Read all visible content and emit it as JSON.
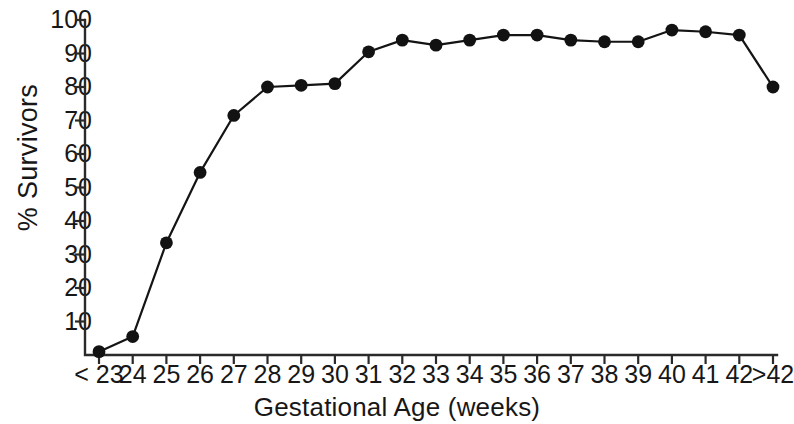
{
  "chart_data": {
    "type": "line",
    "title": "",
    "xlabel": "Gestational Age (weeks)",
    "ylabel": "% Survivors",
    "categories": [
      "< 23",
      "24",
      "25",
      "26",
      "27",
      "28",
      "29",
      "30",
      "31",
      "32",
      "33",
      "34",
      "35",
      "36",
      "37",
      "38",
      "39",
      "40",
      "41",
      "42",
      ">42"
    ],
    "values": [
      1,
      5.5,
      33.5,
      54.5,
      71.5,
      80,
      80.5,
      81,
      90.5,
      94,
      92.5,
      94,
      95.5,
      95.5,
      94,
      93.5,
      93.5,
      97,
      96.5,
      95.5,
      80
    ],
    "ylim": [
      0,
      100
    ],
    "yticks": [
      0,
      10,
      20,
      30,
      40,
      50,
      60,
      70,
      80,
      90,
      100
    ],
    "ytick_labels": [
      "",
      "10",
      "20",
      "30",
      "40",
      "50",
      "60",
      "70",
      "80",
      "90",
      "100"
    ],
    "grid": false,
    "legend": null,
    "marker": "filled-circle",
    "line_color": "#141414",
    "marker_color": "#121212",
    "axis_color": "#2a2a2a",
    "background": "#ffffff"
  }
}
